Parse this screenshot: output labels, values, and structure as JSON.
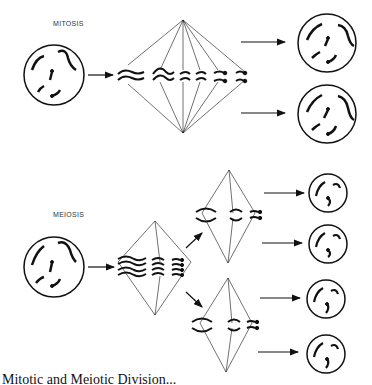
{
  "labels": {
    "mitosis": "MITOSIS",
    "meiosis": "MEIOSIS"
  },
  "caption": "Mitotic and Meiotic Division...",
  "diagram": {
    "mitosis": {
      "parent_cells": 1,
      "daughter_cells": 2,
      "spindles": 1
    },
    "meiosis": {
      "parent_cells": 1,
      "intermediate_spindles": 2,
      "daughter_cells": 4
    }
  }
}
